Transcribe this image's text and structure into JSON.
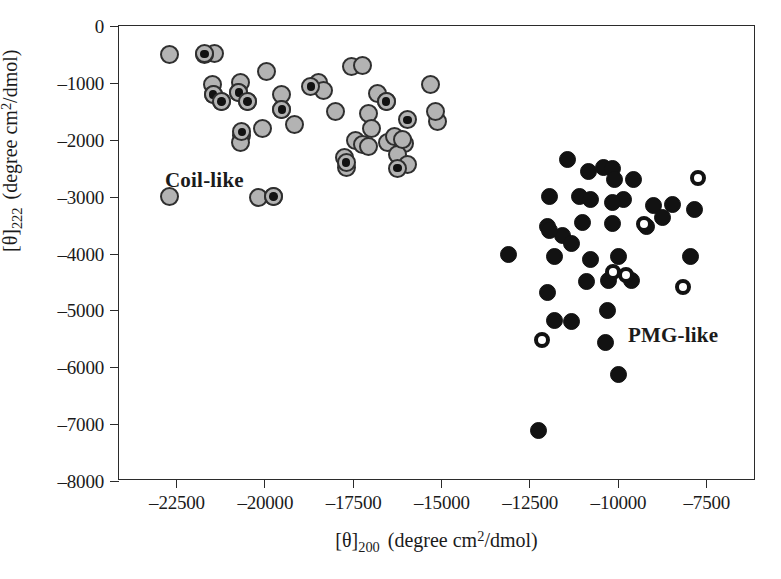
{
  "figure": {
    "background": "#ffffff",
    "frame_color": "#2b2b2b"
  },
  "chart_data": {
    "type": "scatter",
    "title": "",
    "xlabel": "[θ]200  (degree cm2/dmol)",
    "ylabel": "[θ]222  (degree cm2/dmol)",
    "xlim": [
      -23850,
      -6750
    ],
    "ylim": [
      -8000,
      0
    ],
    "grid": false,
    "legend": "none",
    "xticks": [
      -22500,
      -20000,
      -17500,
      -15000,
      -12500,
      -10000,
      -7500
    ],
    "xtick_labels": [
      "–22500",
      "–20000",
      "–17500",
      "–15000",
      "–12500",
      "–10000",
      "–7500"
    ],
    "yticks": [
      0,
      -1000,
      -2000,
      -3000,
      -4000,
      -5000,
      -6000,
      -7000,
      -8000
    ],
    "ytick_labels": [
      "0",
      "–1000",
      "–2000",
      "–3000",
      "–4000",
      "–5000",
      "–6000",
      "–7000",
      "–8000"
    ],
    "annotations": [
      {
        "text": "Coil-like",
        "x": -21700,
        "y": -2700,
        "bold": true
      },
      {
        "text": "PMG-like",
        "x": -9450,
        "y": -5450,
        "bold": true
      }
    ],
    "series": [
      {
        "name": "Coil-like (grey filled circle)",
        "marker": "grey-filled-circle",
        "fill": "#b3b3b3",
        "edge": "#2f2f2f",
        "points": [
          [
            -22500,
            -500
          ],
          [
            -21300,
            -490
          ],
          [
            -21550,
            -500
          ],
          [
            -21350,
            -1030
          ],
          [
            -21320,
            -1200
          ],
          [
            -21100,
            -1330
          ],
          [
            -20600,
            -1000
          ],
          [
            -20630,
            -1170
          ],
          [
            -20400,
            -1330
          ],
          [
            -19900,
            -800
          ],
          [
            -20550,
            -1930
          ],
          [
            -20600,
            -2050
          ],
          [
            -20000,
            -1800
          ],
          [
            -19500,
            -1210
          ],
          [
            -19480,
            -1470
          ],
          [
            -19150,
            -1730
          ],
          [
            -18500,
            -1000
          ],
          [
            -18350,
            -1140
          ],
          [
            -18050,
            -1500
          ],
          [
            -17600,
            -720
          ],
          [
            -17320,
            -700
          ],
          [
            -16900,
            -1190
          ],
          [
            -16680,
            -1330
          ],
          [
            -17150,
            -1540
          ],
          [
            -17080,
            -1800
          ],
          [
            -17500,
            -2020
          ],
          [
            -17320,
            -2090
          ],
          [
            -17150,
            -2120
          ],
          [
            -16650,
            -2040
          ],
          [
            -16180,
            -2060
          ],
          [
            -16380,
            -2260
          ],
          [
            -16100,
            -2440
          ],
          [
            -17800,
            -2320
          ],
          [
            -17750,
            -2480
          ],
          [
            -16450,
            -1950
          ],
          [
            -16250,
            -2000
          ],
          [
            -15500,
            -1030
          ],
          [
            -15300,
            -1680
          ],
          [
            -15350,
            -1510
          ],
          [
            -22500,
            -3000
          ],
          [
            -20100,
            -3010
          ],
          [
            -19700,
            -3000
          ]
        ]
      },
      {
        "name": "Coil-like (grey circle with black centre)",
        "marker": "grey-circle-black-dot",
        "fill": "#b3b3b3",
        "edge": "#2f2f2f",
        "center": "#121212",
        "points": [
          [
            -21550,
            -490
          ],
          [
            -21320,
            -1200
          ],
          [
            -21100,
            -1330
          ],
          [
            -20630,
            -1170
          ],
          [
            -20400,
            -1330
          ],
          [
            -20550,
            -1860
          ],
          [
            -19480,
            -1470
          ],
          [
            -18700,
            -1060
          ],
          [
            -16680,
            -1330
          ],
          [
            -16100,
            -1650
          ],
          [
            -17750,
            -2400
          ],
          [
            -16380,
            -2500
          ],
          [
            -19700,
            -3000
          ]
        ]
      },
      {
        "name": "PMG-like (solid black circle)",
        "marker": "black-filled-circle",
        "fill": "#121212",
        "points": [
          [
            -11800,
            -2350
          ],
          [
            -11250,
            -2550
          ],
          [
            -10850,
            -2480
          ],
          [
            -10600,
            -2500
          ],
          [
            -10550,
            -2700
          ],
          [
            -10050,
            -2700
          ],
          [
            -12300,
            -3000
          ],
          [
            -11500,
            -3000
          ],
          [
            -11200,
            -3050
          ],
          [
            -10300,
            -3050
          ],
          [
            -10600,
            -3100
          ],
          [
            -9500,
            -3150
          ],
          [
            -9000,
            -3140
          ],
          [
            -9250,
            -3370
          ],
          [
            -8400,
            -3230
          ],
          [
            -12350,
            -3520
          ],
          [
            -11400,
            -3450
          ],
          [
            -10600,
            -3480
          ],
          [
            -9700,
            -3530
          ],
          [
            -11950,
            -3680
          ],
          [
            -12300,
            -3600
          ],
          [
            -11700,
            -3830
          ],
          [
            -13400,
            -4020
          ],
          [
            -12150,
            -4060
          ],
          [
            -11200,
            -4100
          ],
          [
            -10450,
            -4050
          ],
          [
            -8500,
            -4060
          ],
          [
            -11300,
            -4500
          ],
          [
            -10700,
            -4480
          ],
          [
            -10100,
            -4480
          ],
          [
            -12350,
            -4680
          ],
          [
            -12150,
            -5180
          ],
          [
            -11700,
            -5200
          ],
          [
            -10750,
            -5000
          ],
          [
            -10800,
            -5560
          ],
          [
            -10450,
            -6130
          ],
          [
            -12600,
            -7120
          ]
        ]
      },
      {
        "name": "PMG-like (open black ring)",
        "marker": "black-ring-white-centre",
        "edge": "#121212",
        "fill": "#ffffff",
        "points": [
          [
            -8300,
            -2680
          ],
          [
            -9750,
            -3480
          ],
          [
            -10600,
            -4330
          ],
          [
            -10250,
            -4370
          ],
          [
            -8700,
            -4580
          ],
          [
            -12500,
            -5520
          ]
        ]
      }
    ]
  }
}
